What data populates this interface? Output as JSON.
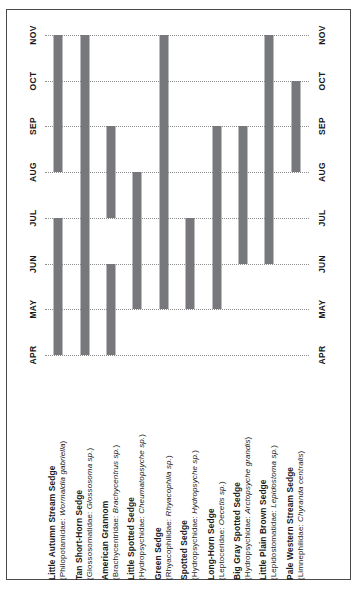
{
  "chart_data": {
    "type": "bar",
    "orientation": "horizontal-rotated",
    "title": "",
    "xlabel": "",
    "ylabel": "",
    "grid": true,
    "legend": "none",
    "axis_months": [
      "APR",
      "MAY",
      "JUN",
      "JUL",
      "AUG",
      "SEP",
      "OCT",
      "NOV"
    ],
    "axis_months_top_to_bottom": [
      "NOV",
      "OCT",
      "SEP",
      "AUG",
      "JUL",
      "JUN",
      "MAY",
      "APR"
    ],
    "bar_color": "#77787b",
    "gridline_color": "#8d8d8d",
    "categories": [
      "Little Autumn Stream Sedge",
      "Tan Short-Horn Sedge",
      "American Grannom",
      "Little Spotted Sedge",
      "Green Sedge",
      "Spotted Sedge",
      "Long-Horn Sedge",
      "Big Gray Spotted Sedge",
      "Little Plain Brown Sedge",
      "Pale Western Stream Sedge"
    ],
    "series": [
      {
        "name": "Emergence period",
        "bars": [
          {
            "category": "Little Autumn Stream Sedge",
            "segments": [
              [
                "APR",
                "JUL"
              ],
              [
                "AUG",
                "NOV"
              ]
            ]
          },
          {
            "category": "Tan Short-Horn Sedge",
            "segments": [
              [
                "APR",
                "NOV"
              ]
            ]
          },
          {
            "category": "American Grannom",
            "segments": [
              [
                "APR",
                "JUN"
              ],
              [
                "JUL",
                "SEP"
              ]
            ]
          },
          {
            "category": "Little Spotted Sedge",
            "segments": [
              [
                "MAY",
                "AUG"
              ]
            ]
          },
          {
            "category": "Green Sedge",
            "segments": [
              [
                "MAY",
                "NOV"
              ]
            ]
          },
          {
            "category": "Spotted Sedge",
            "segments": [
              [
                "MAY",
                "JUL"
              ]
            ]
          },
          {
            "category": "Long-Horn Sedge",
            "segments": [
              [
                "MAY",
                "SEP"
              ]
            ]
          },
          {
            "category": "Big Gray Spotted Sedge",
            "segments": [
              [
                "JUN",
                "SEP"
              ]
            ]
          },
          {
            "category": "Little Plain Brown Sedge",
            "segments": [
              [
                "JUN",
                "NOV"
              ]
            ]
          },
          {
            "category": "Pale Western Stream Sedge",
            "segments": [
              [
                "AUG",
                "OCT"
              ]
            ]
          }
        ]
      }
    ]
  },
  "axis": {
    "months": [
      {
        "label": "NOV"
      },
      {
        "label": "OCT"
      },
      {
        "label": "SEP"
      },
      {
        "label": "AUG"
      },
      {
        "label": "JUL"
      },
      {
        "label": "JUN"
      },
      {
        "label": "MAY"
      },
      {
        "label": "APR"
      }
    ]
  },
  "species": [
    {
      "common": "Little Autumn Stream Sedge",
      "family": "Philopotamidae:",
      "genus": "Wormaldia gabriella",
      "sci_open": "(",
      "sci_close": ")"
    },
    {
      "common": "Tan Short-Horn Sedge",
      "family": "Glossosomatidae:",
      "genus": "Glossosoma sp.",
      "sci_open": "(",
      "sci_close": ")"
    },
    {
      "common": "American Grannom",
      "family": "Brachycentridae:",
      "genus": "Brachycentrus sp.",
      "sci_open": "(",
      "sci_close": ")"
    },
    {
      "common": "Little Spotted Sedge",
      "family": "Hydropsychidae:",
      "genus": "Cheumatopsyche sp.",
      "sci_open": "(",
      "sci_close": ")"
    },
    {
      "common": "Green Sedge",
      "family": "Rhyacophilidae:",
      "genus": "Rhyacophila sp.",
      "sci_open": "(",
      "sci_close": ")"
    },
    {
      "common": "Spotted Sedge",
      "family": "Hydropsychidae:",
      "genus": "Hydropsyche sp.",
      "sci_open": "(",
      "sci_close": ")"
    },
    {
      "common": "Long-Horn Sedge",
      "family": "Leptoceridae:",
      "genus": "Oecetis sp.",
      "sci_open": "(",
      "sci_close": ")"
    },
    {
      "common": "Big Gray Spotted Sedge",
      "family": "Hydropsychidae:",
      "genus": "Arctopsyche grandis",
      "sci_open": "(",
      "sci_close": ")"
    },
    {
      "common": "Little Plain Brown Sedge",
      "family": "Lepidostomatidae:",
      "genus": "Lepidostoma sp.",
      "sci_open": "(",
      "sci_close": ")"
    },
    {
      "common": "Pale Western Stream Sedge",
      "family": "Limnephilidae:",
      "genus": "Chyranda centralis",
      "sci_open": "(",
      "sci_close": ")"
    }
  ]
}
